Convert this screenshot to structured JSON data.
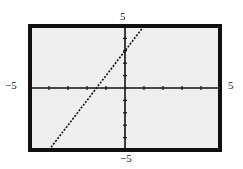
{
  "chart_data": {
    "type": "line",
    "title": "",
    "xlabel": "",
    "ylabel": "",
    "xlim": [
      -5,
      5
    ],
    "ylim": [
      -5,
      5
    ],
    "tick_spacing": 1,
    "grid": false,
    "series": [
      {
        "name": "y = 2x + 3",
        "x": [
          -4,
          1
        ],
        "y": [
          -5,
          5
        ],
        "style": "dotted"
      }
    ]
  },
  "labels": {
    "x_min": "−5",
    "x_max": "5",
    "y_min": "−5",
    "y_max": "5"
  },
  "colors": {
    "plot_background": "#efefef",
    "frame": "#111111",
    "line": "#111111"
  }
}
